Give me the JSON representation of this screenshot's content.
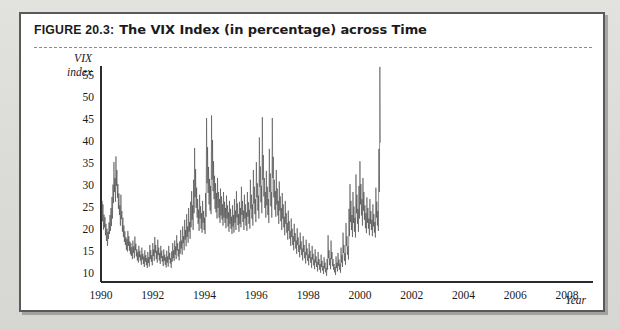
{
  "figure": {
    "number_label": "FIGURE 20.3:",
    "title": "The VIX Index (in percentage) across Time"
  },
  "colors": {
    "page_background": "#dcdcd8",
    "panel_background": "#ffffff",
    "panel_border": "#5a5a5a",
    "caption_rule": "#8d8d8d",
    "axis": "#2b2b2b",
    "series_line": "#3c3c3c",
    "text": "#1a1a1a"
  },
  "chart_data": {
    "type": "line",
    "title": "The VIX Index (in percentage) across Time",
    "xlabel": "Year",
    "ylabel": "VIX index",
    "ylabel_lines": [
      "VIX",
      "index"
    ],
    "grid": false,
    "legend": "none",
    "xlim": [
      1990.0,
      2009.0
    ],
    "ylim": [
      8.0,
      57.0
    ],
    "yticks": [
      10,
      15,
      20,
      25,
      30,
      35,
      40,
      45,
      50,
      55
    ],
    "ytick_labels": [
      "10",
      "15",
      "20",
      "25",
      "30",
      "35",
      "40",
      "45",
      "50",
      "55"
    ],
    "xticks": [
      1990,
      1992,
      1994,
      1996,
      1998,
      2000,
      2002,
      2004,
      2006,
      2008
    ],
    "xtick_labels": [
      "1990",
      "1992",
      "1994",
      "1996",
      "1998",
      "2000",
      "2002",
      "2004",
      "2006",
      "2008"
    ],
    "series": [
      {
        "name": "VIX index",
        "x_start": 1990.0,
        "x_step": 0.019230769,
        "note": "Weekly-resolution VIX closing levels, 1990-01 through 2008-11",
        "values": [
          24.5,
          22.1,
          26.4,
          21.8,
          25.6,
          19.9,
          23.3,
          20.4,
          22.7,
          18.6,
          21.2,
          17.3,
          20.1,
          16.2,
          19.4,
          17.8,
          21.5,
          18.9,
          23.2,
          19.6,
          24.8,
          20.7,
          27.3,
          22.4,
          30.1,
          25.9,
          35.2,
          28.4,
          31.6,
          26.2,
          36.5,
          29.8,
          33.4,
          27.1,
          30.2,
          24.6,
          28.1,
          23.2,
          25.4,
          20.8,
          27.8,
          22.3,
          24.1,
          19.4,
          22.6,
          18.2,
          20.8,
          17.1,
          19.5,
          16.4,
          18.2,
          15.3,
          17.8,
          14.9,
          19.6,
          16.2,
          18.4,
          15.1,
          17.2,
          14.3,
          16.8,
          13.9,
          15.9,
          13.2,
          17.4,
          14.6,
          16.1,
          13.4,
          18.3,
          15.2,
          16.7,
          13.8,
          15.4,
          12.9,
          14.8,
          12.4,
          16.2,
          13.6,
          15.1,
          12.8,
          14.2,
          11.9,
          15.8,
          13.1,
          14.4,
          12.1,
          13.8,
          11.4,
          15.2,
          12.6,
          14.1,
          11.8,
          13.4,
          11.2,
          14.8,
          12.3,
          13.6,
          11.5,
          16.4,
          13.2,
          15.2,
          12.6,
          14.1,
          11.8,
          16.8,
          13.9,
          15.4,
          12.8,
          18.2,
          14.6,
          16.4,
          13.2,
          15.1,
          12.4,
          17.6,
          14.1,
          15.8,
          12.9,
          14.6,
          12.1,
          16.2,
          13.4,
          15.1,
          12.6,
          13.9,
          11.6,
          15.4,
          12.8,
          14.2,
          11.9,
          13.6,
          11.3,
          15.1,
          12.4,
          13.8,
          11.5,
          16.2,
          13.1,
          14.6,
          12.2,
          13.4,
          11.2,
          14.9,
          12.6,
          16.8,
          13.4,
          15.2,
          12.8,
          17.4,
          14.2,
          16.1,
          13.2,
          18.6,
          15.1,
          16.8,
          13.8,
          15.4,
          12.9,
          17.2,
          14.4,
          19.8,
          15.6,
          17.4,
          14.2,
          20.6,
          16.8,
          18.4,
          15.2,
          22.1,
          17.6,
          19.8,
          16.1,
          23.4,
          18.2,
          20.6,
          16.9,
          24.8,
          19.4,
          21.6,
          17.8,
          26.2,
          20.4,
          28.6,
          22.1,
          25.4,
          19.8,
          31.2,
          23.6,
          38.4,
          27.2,
          33.6,
          24.8,
          29.4,
          22.6,
          26.8,
          21.2,
          24.4,
          19.6,
          27.8,
          22.4,
          25.2,
          20.1,
          23.6,
          19.2,
          26.4,
          21.4,
          24.1,
          19.8,
          22.6,
          18.9,
          28.2,
          22.8,
          45.2,
          30.4,
          38.6,
          28.2,
          34.1,
          25.6,
          31.4,
          24.2,
          29.8,
          23.4,
          45.8,
          31.2,
          40.2,
          28.6,
          35.4,
          26.8,
          32.1,
          24.6,
          30.4,
          23.8,
          28.2,
          22.4,
          31.6,
          24.8,
          28.4,
          22.6,
          26.8,
          21.4,
          29.2,
          23.1,
          27.4,
          22.2,
          25.6,
          20.8,
          28.4,
          22.6,
          26.2,
          21.4,
          24.8,
          20.2,
          27.6,
          22.4,
          25.4,
          20.6,
          23.8,
          19.4,
          26.4,
          21.2,
          24.6,
          20.1,
          22.8,
          18.9,
          25.4,
          20.6,
          23.2,
          19.2,
          26.8,
          21.4,
          24.2,
          19.8,
          28.6,
          22.6,
          25.8,
          20.9,
          23.4,
          19.4,
          26.2,
          21.2,
          24.8,
          20.4,
          29.6,
          23.2,
          26.4,
          21.6,
          24.2,
          19.8,
          27.8,
          22.4,
          25.6,
          20.8,
          23.8,
          19.6,
          28.4,
          22.8,
          26.1,
          21.2,
          24.4,
          20.1,
          31.2,
          24.6,
          27.8,
          22.4,
          25.6,
          20.8,
          33.4,
          25.8,
          29.6,
          23.4,
          26.8,
          21.6,
          35.2,
          27.2,
          30.4,
          24.2,
          27.6,
          22.4,
          40.8,
          29.6,
          34.2,
          26.1,
          29.8,
          23.6,
          45.4,
          31.2,
          36.8,
          27.4,
          31.6,
          24.8,
          28.4,
          22.6,
          33.2,
          25.4,
          29.6,
          23.2,
          26.8,
          21.4,
          38.2,
          28.4,
          32.6,
          25.2,
          28.4,
          22.6,
          45.2,
          31.6,
          36.4,
          27.2,
          31.2,
          24.4,
          28.6,
          22.8,
          33.4,
          25.6,
          29.2,
          23.1,
          26.4,
          21.2,
          30.8,
          24.2,
          27.4,
          21.8,
          24.8,
          19.8,
          28.2,
          22.4,
          25.6,
          20.4,
          22.8,
          18.6,
          26.4,
          21.2,
          23.6,
          19.2,
          21.4,
          17.6,
          24.2,
          19.6,
          21.8,
          17.8,
          19.6,
          16.2,
          22.4,
          18.2,
          20.1,
          16.4,
          18.4,
          15.2,
          21.2,
          17.2,
          19.1,
          15.6,
          17.4,
          14.4,
          20.2,
          16.4,
          18.1,
          14.8,
          16.4,
          13.6,
          19.2,
          15.4,
          17.2,
          14.1,
          15.6,
          12.9,
          18.4,
          14.8,
          16.4,
          13.4,
          14.8,
          12.2,
          17.6,
          14.1,
          15.6,
          12.8,
          14.2,
          11.8,
          16.8,
          13.4,
          15.1,
          12.4,
          13.6,
          11.2,
          16.2,
          13.1,
          14.4,
          11.8,
          13.1,
          10.9,
          15.4,
          12.4,
          13.8,
          11.4,
          12.6,
          10.4,
          14.8,
          11.9,
          13.2,
          10.8,
          12.1,
          10.1,
          14.2,
          11.4,
          12.8,
          10.6,
          11.6,
          9.8,
          13.6,
          11.1,
          12.4,
          10.2,
          11.2,
          9.4,
          13.2,
          10.8,
          18.6,
          13.4,
          15.2,
          11.8,
          13.4,
          10.9,
          17.4,
          13.2,
          14.8,
          11.6,
          13.2,
          10.8,
          12.1,
          10.2,
          11.4,
          9.6,
          13.8,
          11.2,
          12.4,
          10.4,
          14.6,
          11.6,
          13.1,
          10.8,
          12.2,
          10.1,
          15.8,
          12.4,
          14.1,
          11.4,
          19.2,
          14.6,
          16.4,
          12.8,
          14.6,
          11.9,
          21.4,
          16.2,
          18.4,
          14.2,
          16.1,
          13.1,
          24.6,
          18.4,
          30.2,
          21.6,
          26.4,
          19.8,
          23.2,
          18.2,
          28.4,
          21.4,
          25.1,
          19.4,
          22.6,
          18.1,
          32.4,
          23.6,
          27.8,
          21.2,
          24.6,
          19.4,
          29.8,
          22.4,
          35.4,
          25.6,
          30.2,
          23.1,
          26.8,
          20.8,
          31.6,
          24.2,
          28.4,
          22.1,
          25.4,
          20.2,
          23.6,
          19.1,
          27.2,
          21.4,
          24.8,
          20.1,
          22.4,
          18.6,
          26.8,
          21.2,
          24.1,
          19.8,
          22.1,
          18.4,
          25.6,
          20.6,
          23.4,
          19.2,
          21.6,
          18.1,
          29.4,
          22.6,
          26.2,
          20.8,
          24.1,
          19.6,
          38.2,
          28.4,
          56.8,
          39.6
        ]
      }
    ]
  }
}
